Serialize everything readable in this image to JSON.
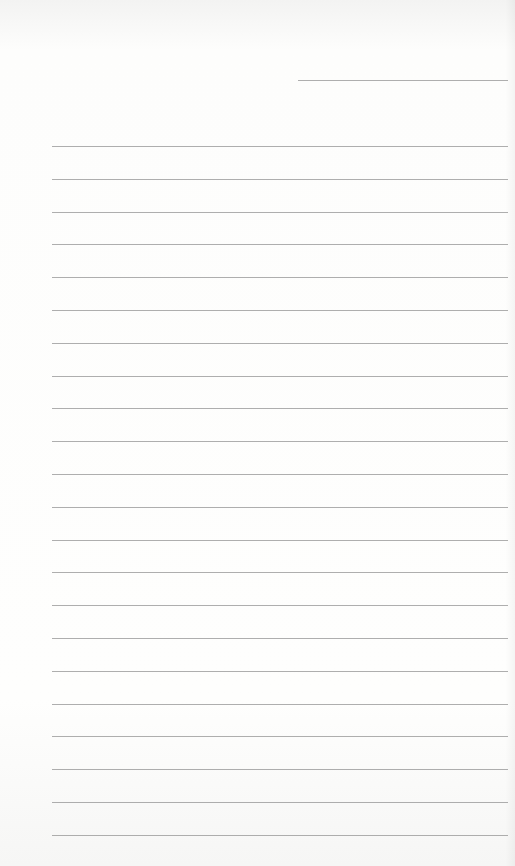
{
  "paper": {
    "background": "#fbfbfa",
    "line_color": "#9a9a9a",
    "header_line": {
      "x1": 298,
      "x2": 508,
      "y": 80
    },
    "ruled_lines": {
      "count": 22,
      "x1": 52,
      "x2": 508,
      "first_y": 146,
      "spacing": 32.8
    }
  }
}
